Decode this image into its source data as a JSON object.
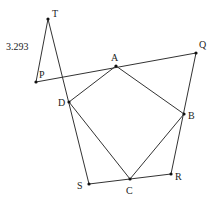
{
  "diagram": {
    "type": "geometry",
    "line_color": "#333333",
    "point_color": "#111111",
    "points": [
      {
        "id": "T",
        "label": "T",
        "x": 48,
        "y": 19,
        "lx": 52,
        "ly": 17
      },
      {
        "id": "P",
        "label": "P",
        "x": 36,
        "y": 82,
        "lx": 39,
        "ly": 78
      },
      {
        "id": "A",
        "label": "A",
        "x": 116,
        "y": 66,
        "lx": 111,
        "ly": 61
      },
      {
        "id": "Q",
        "label": "Q",
        "x": 196,
        "y": 53,
        "lx": 199,
        "ly": 48
      },
      {
        "id": "D",
        "label": "D",
        "x": 69,
        "y": 102,
        "lx": 58,
        "ly": 106
      },
      {
        "id": "B",
        "label": "B",
        "x": 184,
        "y": 114,
        "lx": 188,
        "ly": 119
      },
      {
        "id": "S",
        "label": "S",
        "x": 89,
        "y": 184,
        "lx": 77,
        "ly": 189
      },
      {
        "id": "C",
        "label": "C",
        "x": 130,
        "y": 179,
        "lx": 126,
        "ly": 194
      },
      {
        "id": "R",
        "label": "R",
        "x": 171,
        "y": 174,
        "lx": 175,
        "ly": 180
      }
    ],
    "segments": [
      [
        "T",
        "P"
      ],
      [
        "T",
        "S"
      ],
      [
        "P",
        "Q"
      ],
      [
        "Q",
        "R"
      ],
      [
        "S",
        "R"
      ],
      [
        "A",
        "B"
      ],
      [
        "B",
        "C"
      ],
      [
        "C",
        "D"
      ],
      [
        "D",
        "A"
      ]
    ],
    "measurement": {
      "text": "3.293",
      "x": 6,
      "y": 50,
      "segment": [
        "T",
        "P"
      ]
    }
  }
}
